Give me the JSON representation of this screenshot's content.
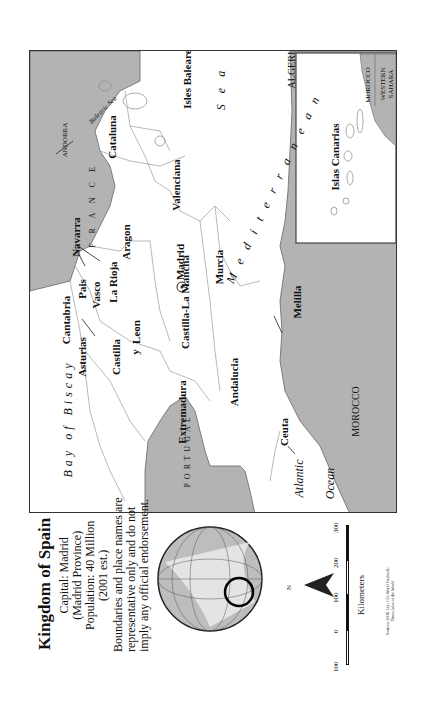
{
  "title": "Kingdom of Spain",
  "info": {
    "capital": "Capital: Madrid",
    "province": "(Madrid Province)",
    "population": "Population: 40 Million",
    "estimate": "(2001 est.)"
  },
  "disclaimer": [
    "Boundaries and place names are",
    "representative only and do not",
    "imply any official endorsement."
  ],
  "scale": {
    "ticks": [
      "100",
      "0",
      "100",
      "200",
      "300"
    ],
    "unit": "Kilometers",
    "north": "N"
  },
  "source": [
    "Sources: ESRI Ltd.; CIA World Factbook;",
    "Times Atlas of the World"
  ],
  "regions": [
    {
      "name": "Galicia"
    },
    {
      "name": "Asturias"
    },
    {
      "name": "Cantabria"
    },
    {
      "name": "Pais"
    },
    {
      "name": "Vasco"
    },
    {
      "name": "Navarra"
    },
    {
      "name": "La Rioja"
    },
    {
      "name": "Aragon"
    },
    {
      "name": "Cataluna"
    },
    {
      "name": "Castilla"
    },
    {
      "name": "y"
    },
    {
      "name": "Leon"
    },
    {
      "name": "Madrid"
    },
    {
      "name": "Castilla-La Mancha"
    },
    {
      "name": "Valenciana"
    },
    {
      "name": "Murcia"
    },
    {
      "name": "Extremadura"
    },
    {
      "name": "Andalucia"
    },
    {
      "name": "Isles Baleares"
    },
    {
      "name": "Ceuta"
    },
    {
      "name": "Melilla"
    }
  ],
  "countries": {
    "france": "F R A N C E",
    "andorra": "ANDORRA",
    "portugal": "PORTUGAL",
    "morocco": "MOROCCO",
    "algeria": "ALGERIA",
    "inset_morocco": "MOROCCO",
    "western_sahara_1": "WESTERN",
    "western_sahara_2": "SAHARA"
  },
  "water": {
    "bay_of_biscay": "Bay  of  Biscay",
    "atlantic": "Atlantic",
    "ocean": "Ocean",
    "mediterranean": "M e d i t e r r a n e a n",
    "sea": "S e a",
    "balearic_sea": "Balearic Sea"
  },
  "inset": {
    "label": "Islas Canarias"
  },
  "colors": {
    "land_other": "#b3b3b3",
    "land_spain": "#ffffff",
    "border": "#333333",
    "region_line": "#999999"
  }
}
